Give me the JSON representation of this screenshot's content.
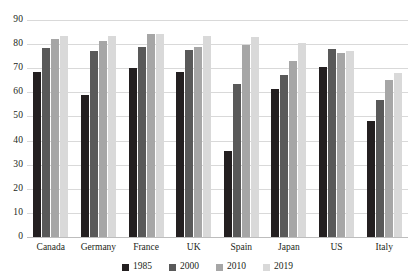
{
  "chart_data": {
    "type": "bar",
    "title": "",
    "subtitle": "",
    "xlabel": "",
    "ylabel": "",
    "ylim": [
      0,
      90
    ],
    "yticks": [
      0,
      10,
      20,
      30,
      40,
      50,
      60,
      70,
      80,
      90
    ],
    "grid": true,
    "legend_position": "bottom",
    "categories": [
      "Canada",
      "Germany",
      "France",
      "UK",
      "Spain",
      "Japan",
      "US",
      "Italy"
    ],
    "series": [
      {
        "name": "1985",
        "color": "#231f20",
        "values": [
          68.5,
          59,
          70,
          68.5,
          35.5,
          61.5,
          70.5,
          48
        ]
      },
      {
        "name": "2000",
        "color": "#595959",
        "values": [
          78.5,
          77,
          79,
          77.5,
          63.5,
          67,
          78,
          57
        ]
      },
      {
        "name": "2010",
        "color": "#a6a6a6",
        "values": [
          82,
          81.5,
          84,
          79,
          79.5,
          73,
          76.5,
          65
        ]
      },
      {
        "name": "2019",
        "color": "#d9d9d9",
        "values": [
          83.5,
          83.5,
          84,
          83.5,
          83,
          80.5,
          77,
          68
        ]
      }
    ]
  },
  "axis": {
    "y_tick_labels": [
      "0",
      "10",
      "20",
      "30",
      "40",
      "50",
      "60",
      "70",
      "80",
      "90"
    ]
  }
}
